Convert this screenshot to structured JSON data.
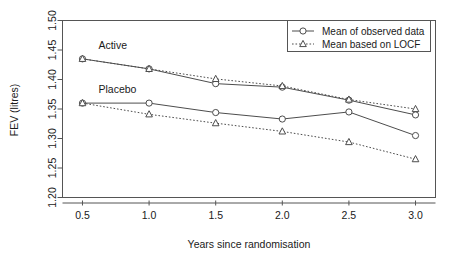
{
  "chart_data": {
    "type": "line",
    "title": "",
    "xlabel": "Years since randomisation",
    "ylabel": "FEV (litres)",
    "x": [
      0.5,
      1.0,
      1.5,
      2.0,
      2.5,
      3.0
    ],
    "xlim": [
      0.35,
      3.15
    ],
    "ylim": [
      1.2,
      1.5
    ],
    "xticks": [
      "0.5",
      "1.0",
      "1.5",
      "2.0",
      "2.5",
      "3.0"
    ],
    "yticks": [
      "1.20",
      "1.25",
      "1.30",
      "1.35",
      "1.40",
      "1.45",
      "1.50"
    ],
    "grid": false,
    "legend_position": "top-right",
    "series": [
      {
        "name": "Active - Mean of observed data",
        "group": "Active",
        "style": "solid",
        "marker": "circle",
        "values": [
          1.435,
          1.418,
          1.393,
          1.387,
          1.365,
          1.34
        ]
      },
      {
        "name": "Active - Mean based on LOCF",
        "group": "Active",
        "style": "dotted",
        "marker": "triangle",
        "values": [
          1.435,
          1.418,
          1.401,
          1.389,
          1.366,
          1.35
        ]
      },
      {
        "name": "Placebo - Mean of observed data",
        "group": "Placebo",
        "style": "solid",
        "marker": "circle",
        "values": [
          1.36,
          1.36,
          1.344,
          1.333,
          1.345,
          1.305
        ]
      },
      {
        "name": "Placebo - Mean based on LOCF",
        "group": "Placebo",
        "style": "dotted",
        "marker": "triangle",
        "values": [
          1.36,
          1.341,
          1.326,
          1.312,
          1.294,
          1.265
        ]
      }
    ],
    "annotations": [
      {
        "text": "Active",
        "x": 0.62,
        "y": 1.452
      },
      {
        "text": "Placebo",
        "x": 0.62,
        "y": 1.377
      }
    ],
    "legend": [
      {
        "label": "Mean of observed data",
        "style": "solid",
        "marker": "circle"
      },
      {
        "label": "Mean based on LOCF",
        "style": "dotted",
        "marker": "triangle"
      }
    ],
    "colors": {
      "line": "#4d4d4d",
      "axis": "#555555",
      "text": "#1a1a1a",
      "background": "#ffffff"
    }
  }
}
